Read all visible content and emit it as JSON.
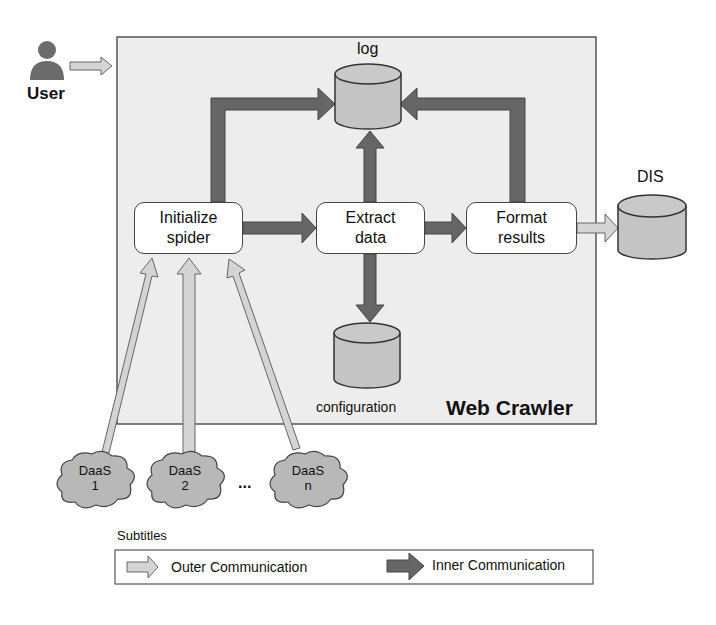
{
  "actor": {
    "label": "User",
    "icon": "user-icon"
  },
  "container": {
    "title": "Web Crawler",
    "bg": "#eeeeee",
    "border": "#555555"
  },
  "stores": {
    "log": {
      "label": "log"
    },
    "configuration": {
      "label": "configuration"
    },
    "dis": {
      "label": "DIS"
    }
  },
  "processes": [
    {
      "line1": "Initialize",
      "line2": "spider"
    },
    {
      "line1": "Extract",
      "line2": "data"
    },
    {
      "line1": "Format",
      "line2": "results"
    }
  ],
  "sources": [
    {
      "line1": "DaaS",
      "line2": "1"
    },
    {
      "line1": "DaaS",
      "line2": "2"
    },
    {
      "line1": "DaaS",
      "line2": "n"
    }
  ],
  "ellipsis": "...",
  "legend": {
    "title": "Subtitles",
    "outer": "Outer Communication",
    "inner": "Inner Communication"
  },
  "colors": {
    "outer_arrow": "#d4d4d4",
    "inner_arrow": "#666666",
    "cylinder": "#c4c4c4",
    "cloud": "#b8b8b8"
  }
}
